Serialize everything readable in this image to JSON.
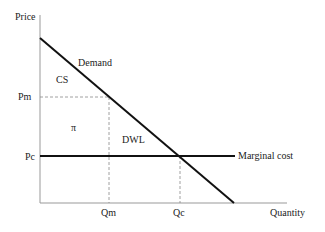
{
  "diagram": {
    "type": "monopoly-deadweight-loss",
    "axes": {
      "y_label": "Price",
      "x_label": "Quantity"
    },
    "curves": {
      "demand_label": "Demand",
      "marginal_cost_label": "Marginal cost"
    },
    "price_ticks": {
      "monopoly": "Pm",
      "competitive": "Pc"
    },
    "quantity_ticks": {
      "monopoly": "Qm",
      "competitive": "Qc"
    },
    "regions": {
      "consumer_surplus": "CS",
      "profit": "π",
      "deadweight_loss": "DWL"
    },
    "colors": {
      "axis": "#999999",
      "curve": "#111111",
      "guide": "#888888",
      "text": "#222222"
    }
  }
}
